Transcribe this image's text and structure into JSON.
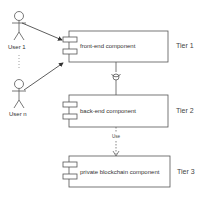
{
  "actors": [
    {
      "id": "user1",
      "label": "User 1"
    },
    {
      "id": "usern",
      "label": "User n"
    }
  ],
  "components": [
    {
      "id": "frontend",
      "label": "front-end component",
      "tier": "Tier 1"
    },
    {
      "id": "backend",
      "label": "back-end component",
      "tier": "Tier 2"
    },
    {
      "id": "blockchain",
      "label": "private blockchain component",
      "tier": "Tier 3"
    }
  ],
  "connectors": {
    "frontend_backend": "interface (ball-and-socket)",
    "backend_blockchain": "Use"
  },
  "colors": {
    "line": "#555555",
    "background": "#ffffff"
  }
}
